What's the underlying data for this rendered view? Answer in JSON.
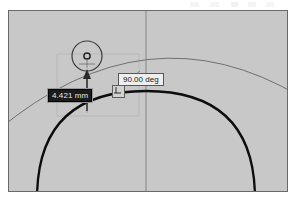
{
  "app": {
    "view_name": "cad-sketch-viewport",
    "background_color": "#c8c8c8",
    "border_color": "#6a6a6a"
  },
  "dimension": {
    "value_label": "4.421 mm",
    "state": "selected",
    "text_color": "#e8e8e8",
    "fill_color": "#1b1b1b"
  },
  "angle": {
    "value_label": "90.00 deg",
    "state": "normal",
    "text_color": "#151515",
    "fill_color": "#efefef"
  },
  "constraint": {
    "name": "perpendicular-constraint",
    "symbol": "perpendicular"
  },
  "geometry": {
    "circle": {
      "name": "sketch-circle",
      "center_x": 86,
      "center_y": 55,
      "radius": 15,
      "color": "#3c3c3c"
    },
    "center_point": {
      "name": "circle-center-point",
      "center_x": 86,
      "center_y": 55,
      "radius": 3,
      "color": "#2a2a2a"
    },
    "bold_arc": {
      "name": "profile-arc-bold",
      "color": "#0d0d0d",
      "width": 2.2
    },
    "thin_arc": {
      "name": "construction-arc-thin",
      "color": "#6b6b6b",
      "width": 1
    },
    "centerline": {
      "name": "vertical-centerline",
      "x": 145,
      "color": "#7a7a7a"
    },
    "construction_box": {
      "name": "construction-rectangle",
      "color": "#b0b0b0"
    },
    "dimension_arrow": {
      "name": "dimension-arrow",
      "color": "#2b2b2b",
      "direction": "up"
    }
  }
}
